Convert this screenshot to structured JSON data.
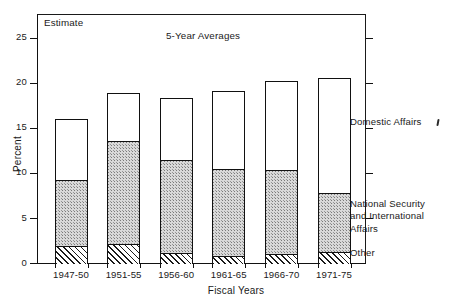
{
  "figure": {
    "subtitle": "5-Year Averages",
    "estimate_note": "Estimate",
    "xlabel": "Fiscal Years",
    "ylabel": "Percent"
  },
  "legend": {
    "top": "Domestic Affairs",
    "middle": "National Security\nand International\nAffairs",
    "bottom": "Other"
  },
  "axis": {
    "yticks": [
      "0",
      "5",
      "10",
      "15",
      "20",
      "25"
    ],
    "ytick_values": [
      0,
      5,
      10,
      15,
      20,
      25
    ]
  },
  "chart_data": {
    "type": "bar",
    "stacked": true,
    "title": "5-Year Averages",
    "xlabel": "Fiscal Years",
    "ylabel": "Percent",
    "ylim": [
      0,
      27
    ],
    "grid": false,
    "legend_position": "right",
    "annotations": [
      "Estimate"
    ],
    "categories": [
      "1947-50",
      "1951-55",
      "1956-60",
      "1961-65",
      "1966-70",
      "1971-75"
    ],
    "series": [
      {
        "name": "Other",
        "fill": "diagonal-hatch",
        "values": [
          2.0,
          2.2,
          1.2,
          0.9,
          1.1,
          1.3
        ]
      },
      {
        "name": "National Security and International Affairs",
        "fill": "stipple",
        "values": [
          7.3,
          11.4,
          10.3,
          9.6,
          9.3,
          6.6
        ]
      },
      {
        "name": "Domestic Affairs",
        "fill": "white",
        "values": [
          6.7,
          5.3,
          6.8,
          8.6,
          9.8,
          12.6
        ]
      }
    ],
    "cumulative_tops": [
      {
        "category": "1947-50",
        "other": 2.0,
        "national_security": 9.3,
        "total": 16.0
      },
      {
        "category": "1951-55",
        "other": 2.2,
        "national_security": 13.6,
        "total": 18.9
      },
      {
        "category": "1956-60",
        "other": 1.2,
        "national_security": 11.5,
        "total": 18.3
      },
      {
        "category": "1961-65",
        "other": 0.9,
        "national_security": 10.5,
        "total": 19.1
      },
      {
        "category": "1966-70",
        "other": 1.1,
        "national_security": 10.4,
        "total": 20.2
      },
      {
        "category": "1971-75",
        "other": 1.3,
        "national_security": 7.9,
        "total": 20.5
      }
    ]
  }
}
